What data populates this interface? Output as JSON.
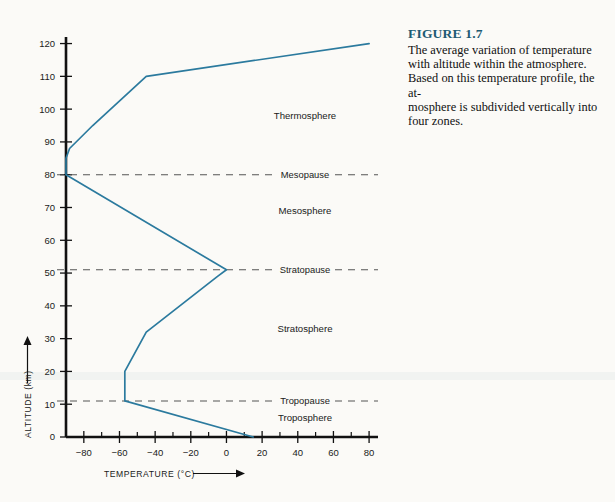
{
  "figure": {
    "number_label": "FIGURE 1.7",
    "caption_lines": [
      "The average variation of temperature",
      "with altitude within the atmosphere.",
      "Based on this temperature profile, the at-",
      "mosphere is subdivided vertically into",
      "four zones."
    ],
    "title_color": "#1d5b73"
  },
  "chart_data": {
    "type": "line",
    "title": "",
    "xlabel": "TEMPERATURE (°C)",
    "ylabel": "ALTITUDE (km)",
    "xlim": [
      -90,
      85
    ],
    "ylim": [
      0,
      122
    ],
    "grid": false,
    "legend": "none",
    "line_color": "#2b7a9e",
    "axis_color": "#111111",
    "x_ticks_major": [
      -80,
      -60,
      -40,
      -20,
      0,
      20,
      40,
      60,
      80
    ],
    "x_tick_labels": [
      "−80",
      "−60",
      "−40",
      "−20",
      "0",
      "20",
      "40",
      "60",
      "80"
    ],
    "x_ticks_minor": [
      -90,
      -70,
      -50,
      -30,
      -10,
      10,
      30,
      50,
      70
    ],
    "y_ticks_major": [
      0,
      10,
      20,
      30,
      40,
      50,
      60,
      70,
      80,
      90,
      100,
      110,
      120
    ],
    "y_tick_labels": [
      "0",
      "10",
      "20",
      "30",
      "40",
      "50",
      "60",
      "70",
      "80",
      "90",
      "100",
      "110",
      "120"
    ],
    "series": [
      {
        "name": "Average temperature profile",
        "x": [
          15,
          -57,
          -57,
          -45,
          -5,
          0,
          -90,
          -90,
          -88,
          -75,
          -45,
          80
        ],
        "y": [
          0,
          11,
          20,
          32,
          49,
          51,
          80,
          85,
          88,
          95,
          110,
          120
        ]
      }
    ],
    "boundaries": [
      {
        "name": "Mesopause",
        "altitude_km": 80
      },
      {
        "name": "Stratopause",
        "altitude_km": 51
      },
      {
        "name": "Tropopause",
        "altitude_km": 11
      }
    ],
    "zones": [
      {
        "name": "Thermosphere",
        "label_altitude_km": 98,
        "label_temperature_c": -2
      },
      {
        "name": "Mesosphere",
        "label_altitude_km": 69,
        "label_temperature_c": -8
      },
      {
        "name": "Stratosphere",
        "label_altitude_km": 33,
        "label_temperature_c": -8
      },
      {
        "name": "Troposphere",
        "label_altitude_km": 6,
        "label_temperature_c": -5
      }
    ]
  }
}
